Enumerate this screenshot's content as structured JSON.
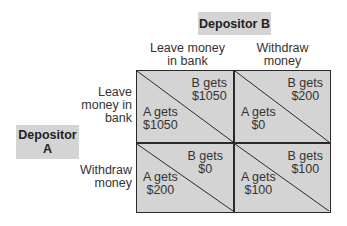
{
  "diagram": {
    "type": "payoff-matrix",
    "player_b": {
      "label": "Depositor B"
    },
    "player_a": {
      "label_line1": "Depositor",
      "label_line2": "A"
    },
    "columns": [
      {
        "line1": "Leave money",
        "line2": "in bank"
      },
      {
        "line1": "Withdraw",
        "line2": "money"
      }
    ],
    "rows": [
      {
        "line1": "Leave",
        "line2": "money in",
        "line3": "bank"
      },
      {
        "line1": "Withdraw",
        "line2": "money"
      }
    ],
    "cells": [
      {
        "b_label": "B gets",
        "b_value": "$1050",
        "a_label": "A gets",
        "a_value": "$1050"
      },
      {
        "b_label": "B gets",
        "b_value": "$200",
        "a_label": "A gets",
        "a_value": "$0"
      },
      {
        "b_label": "B gets",
        "b_value": "$0",
        "a_label": "A gets",
        "a_value": "$200"
      },
      {
        "b_label": "B gets",
        "b_value": "$100",
        "a_label": "A gets",
        "a_value": "$100"
      }
    ],
    "colors": {
      "cell_fill": "#d4d4d4",
      "label_box_fill": "#d4d4d4",
      "line": "#2a2a2a"
    }
  }
}
